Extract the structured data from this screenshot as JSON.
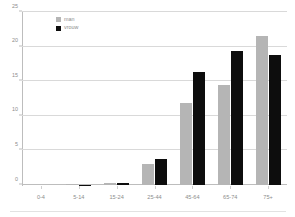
{
  "legend": {
    "position": "top-left-inside",
    "entries": [
      {
        "label": "man",
        "color": "#b5b5b5"
      },
      {
        "label": "vrouw",
        "color": "#0d0d0d"
      }
    ]
  },
  "yaxis": {
    "ticks": [
      "0",
      "5",
      "10",
      "15",
      "20",
      "25"
    ]
  },
  "chart_data": {
    "type": "bar",
    "title": "",
    "subtitle": "",
    "xlabel": "",
    "ylabel": "",
    "categories": [
      "0-4",
      "5-14",
      "15-24",
      "25-44",
      "45-64",
      "65-74",
      "75+"
    ],
    "series": [
      {
        "name": "man",
        "color": "#b5b5b5",
        "values": [
          0.0,
          0.15,
          0.3,
          3.0,
          11.8,
          14.5,
          21.6
        ]
      },
      {
        "name": "vrouw",
        "color": "#0d0d0d",
        "values": [
          0.0,
          0.05,
          0.3,
          3.8,
          16.3,
          19.3,
          18.8
        ]
      }
    ],
    "ylim": [
      0,
      25
    ],
    "ytick_values": [
      0,
      5,
      10,
      15,
      20,
      25
    ],
    "grid": true,
    "legend_position": "top-left"
  }
}
